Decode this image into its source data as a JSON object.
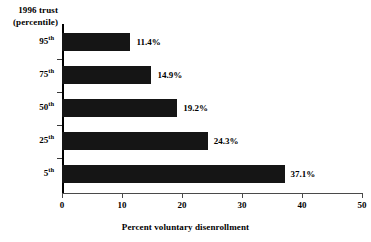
{
  "chart_data": {
    "type": "bar",
    "orientation": "horizontal",
    "title": "",
    "xlabel": "Percent voluntary disenrollment",
    "ylabel": "1996 trust (percentile)",
    "ylabel_lines": [
      "1996 trust",
      "(percentile)"
    ],
    "categories": [
      "95th",
      "75th",
      "50th",
      "25th",
      "5th"
    ],
    "category_parts": [
      {
        "num": "95",
        "sup": "th"
      },
      {
        "num": "75",
        "sup": "th"
      },
      {
        "num": "50",
        "sup": "th"
      },
      {
        "num": "25",
        "sup": "th"
      },
      {
        "num": "5",
        "sup": "th"
      }
    ],
    "values": [
      11.4,
      14.9,
      19.2,
      24.3,
      37.1
    ],
    "value_labels": [
      "11.4%",
      "14.9%",
      "19.2%",
      "24.3%",
      "37.1%"
    ],
    "xlim": [
      0,
      50
    ],
    "xticks": [
      0,
      10,
      20,
      30,
      40,
      50
    ],
    "xtick_labels": [
      "0",
      "10",
      "20",
      "30",
      "40",
      "50"
    ],
    "grid": false,
    "legend": false,
    "bar_color": "#151515",
    "axis_color": "#000000",
    "background": "#ffffff"
  }
}
